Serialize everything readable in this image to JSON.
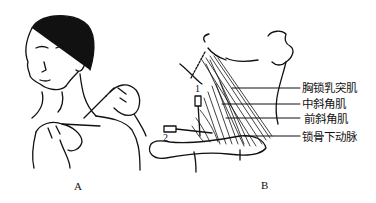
{
  "panels": {
    "a": {
      "label": "A"
    },
    "b": {
      "label": "B"
    }
  },
  "annotations": [
    {
      "text": "胸锁乳突肌"
    },
    {
      "text": "中斜角肌"
    },
    {
      "text": "前斜角肌"
    },
    {
      "text": "锁骨下动脉"
    }
  ],
  "needle_markers": {
    "first": "1",
    "second": "2"
  }
}
